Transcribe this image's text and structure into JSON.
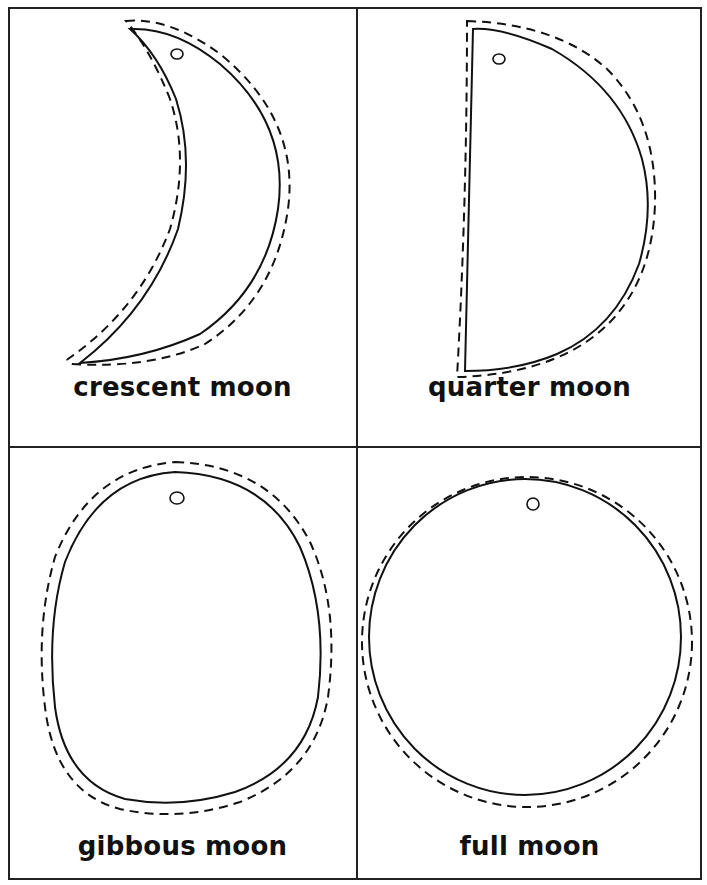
{
  "worksheet": {
    "title": "Moon phases cut-out template",
    "cards": [
      {
        "id": "crescent",
        "label": "crescent moon",
        "shape": "crescent",
        "has_hole": true
      },
      {
        "id": "quarter",
        "label": "quarter moon",
        "shape": "half-disc",
        "has_hole": true
      },
      {
        "id": "gibbous",
        "label": "gibbous moon",
        "shape": "oval",
        "has_hole": true
      },
      {
        "id": "full",
        "label": "full moon",
        "shape": "circle",
        "has_hole": true
      }
    ],
    "line_styles": {
      "outline": "solid",
      "cut_line": "dashed"
    },
    "colors": {
      "ink": "#111111",
      "paper": "#ffffff",
      "border": "#222222"
    }
  }
}
